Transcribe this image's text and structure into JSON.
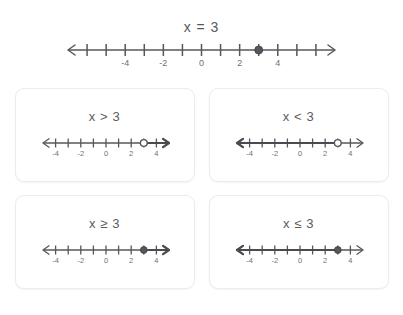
{
  "chart_data": {
    "type": "line",
    "title": "x = 3",
    "xlabel": "",
    "ylabel": "",
    "main": {
      "title": "x = 3",
      "axis_min": -7,
      "axis_max": 7,
      "tick_step": 1,
      "tick_labels": [
        {
          "value": -4,
          "text": "-4"
        },
        {
          "value": -2,
          "text": "-2"
        },
        {
          "value": 0,
          "text": "0"
        },
        {
          "value": 2,
          "text": "2"
        },
        {
          "value": 4,
          "text": "4"
        }
      ],
      "point": {
        "value": 3,
        "style": "closed"
      },
      "ray": null,
      "arrows": "both"
    },
    "cards": [
      {
        "id": "greater-than",
        "title": "x > 3",
        "axis_min": -5,
        "axis_max": 5,
        "tick_step": 1,
        "tick_labels": [
          {
            "value": -4,
            "text": "-4"
          },
          {
            "value": -2,
            "text": "-2"
          },
          {
            "value": 0,
            "text": "0"
          },
          {
            "value": 2,
            "text": "2"
          },
          {
            "value": 4,
            "text": "4"
          }
        ],
        "point": {
          "value": 3,
          "style": "open"
        },
        "ray": {
          "from": 3,
          "direction": "right"
        },
        "arrows": "both"
      },
      {
        "id": "less-than",
        "title": "x < 3",
        "axis_min": -5,
        "axis_max": 5,
        "tick_step": 1,
        "tick_labels": [
          {
            "value": -4,
            "text": "-4"
          },
          {
            "value": -2,
            "text": "-2"
          },
          {
            "value": 0,
            "text": "0"
          },
          {
            "value": 2,
            "text": "2"
          },
          {
            "value": 4,
            "text": "4"
          }
        ],
        "point": {
          "value": 3,
          "style": "open"
        },
        "ray": {
          "from": 3,
          "direction": "left"
        },
        "arrows": "both"
      },
      {
        "id": "greater-or-equal",
        "title": "x ≥ 3",
        "axis_min": -5,
        "axis_max": 5,
        "tick_step": 1,
        "tick_labels": [
          {
            "value": -4,
            "text": "-4"
          },
          {
            "value": -2,
            "text": "-2"
          },
          {
            "value": 0,
            "text": "0"
          },
          {
            "value": 2,
            "text": "2"
          },
          {
            "value": 4,
            "text": "4"
          }
        ],
        "point": {
          "value": 3,
          "style": "closed"
        },
        "ray": {
          "from": 3,
          "direction": "right"
        },
        "arrows": "both"
      },
      {
        "id": "less-or-equal",
        "title": "x ≤ 3",
        "axis_min": -5,
        "axis_max": 5,
        "tick_step": 1,
        "tick_labels": [
          {
            "value": -4,
            "text": "-4"
          },
          {
            "value": -2,
            "text": "-2"
          },
          {
            "value": 0,
            "text": "0"
          },
          {
            "value": 2,
            "text": "2"
          },
          {
            "value": 4,
            "text": "4"
          }
        ],
        "point": {
          "value": 3,
          "style": "closed"
        },
        "ray": {
          "from": 3,
          "direction": "left"
        },
        "arrows": "both"
      }
    ],
    "colors": {
      "line": "#57575b",
      "label": "#6f6f74",
      "title": "#58585c",
      "dot_fill": "#56565c",
      "dot_open_fill": "#ffffff",
      "card_border": "#ececed",
      "background": "#ffffff"
    }
  }
}
